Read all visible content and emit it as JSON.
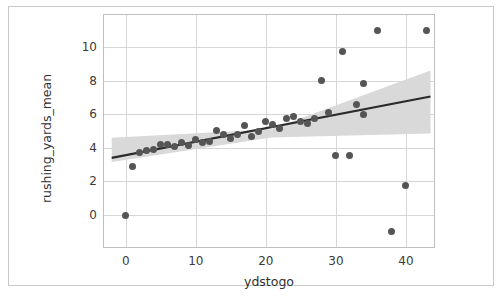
{
  "figure": {
    "background": "#ffffff",
    "frame_color": "#c9c9c9",
    "axes_color": "#bfbfbf",
    "grid_color": "#d6d6d6"
  },
  "chart_data": {
    "type": "scatter",
    "title": "",
    "xlabel": "ydstogo",
    "ylabel": "rushing_yards_mean",
    "xlim": [
      -3.1,
      44.0
    ],
    "ylim": [
      -1.9,
      11.9
    ],
    "xticks": [
      0,
      10,
      20,
      30,
      40
    ],
    "xticklabels": [
      "0",
      "10",
      "20",
      "30",
      "40"
    ],
    "yticks": [
      0,
      2,
      4,
      6,
      8,
      10
    ],
    "yticklabels": [
      "0",
      "2",
      "4",
      "6",
      "8",
      "10"
    ],
    "grid": true,
    "legend": null,
    "marker_color": "#555555",
    "line_color": "#2b2b2b",
    "band_color": "#d9d9d9",
    "points": [
      {
        "x": 0,
        "y": 0.0
      },
      {
        "x": 1,
        "y": 2.88
      },
      {
        "x": 2,
        "y": 3.72
      },
      {
        "x": 3,
        "y": 3.86
      },
      {
        "x": 4,
        "y": 3.9
      },
      {
        "x": 5,
        "y": 4.22
      },
      {
        "x": 6,
        "y": 4.2
      },
      {
        "x": 7,
        "y": 4.05
      },
      {
        "x": 8,
        "y": 4.3
      },
      {
        "x": 9,
        "y": 4.12
      },
      {
        "x": 10,
        "y": 4.5
      },
      {
        "x": 11,
        "y": 4.32
      },
      {
        "x": 12,
        "y": 4.38
      },
      {
        "x": 13,
        "y": 5.03
      },
      {
        "x": 14,
        "y": 4.8
      },
      {
        "x": 15,
        "y": 4.55
      },
      {
        "x": 16,
        "y": 4.82
      },
      {
        "x": 17,
        "y": 5.35
      },
      {
        "x": 18,
        "y": 4.68
      },
      {
        "x": 19,
        "y": 5.0
      },
      {
        "x": 20,
        "y": 5.55
      },
      {
        "x": 21,
        "y": 5.4
      },
      {
        "x": 22,
        "y": 5.15
      },
      {
        "x": 23,
        "y": 5.75
      },
      {
        "x": 24,
        "y": 5.88
      },
      {
        "x": 25,
        "y": 5.55
      },
      {
        "x": 26,
        "y": 5.45
      },
      {
        "x": 27,
        "y": 5.75
      },
      {
        "x": 28,
        "y": 8.0
      },
      {
        "x": 29,
        "y": 6.1
      },
      {
        "x": 30,
        "y": 3.55
      },
      {
        "x": 31,
        "y": 9.75
      },
      {
        "x": 32,
        "y": 3.55
      },
      {
        "x": 33,
        "y": 6.55
      },
      {
        "x": 34,
        "y": 6.0
      },
      {
        "x": 34,
        "y": 7.8
      },
      {
        "x": 36,
        "y": 10.95
      },
      {
        "x": 38,
        "y": -1.0
      },
      {
        "x": 40,
        "y": 1.78
      },
      {
        "x": 43,
        "y": 10.95
      }
    ],
    "regression_line": {
      "x_start": -2.0,
      "y_start": 3.4,
      "x_end": 43.5,
      "y_end": 7.05
    },
    "confidence_band": {
      "x_start": -2.0,
      "x_end": 43.5,
      "upper_start": 4.6,
      "lower_start": 3.15,
      "upper_mid": 5.1,
      "lower_mid": 4.62,
      "upper_end": 8.6,
      "lower_end": 4.85
    }
  }
}
